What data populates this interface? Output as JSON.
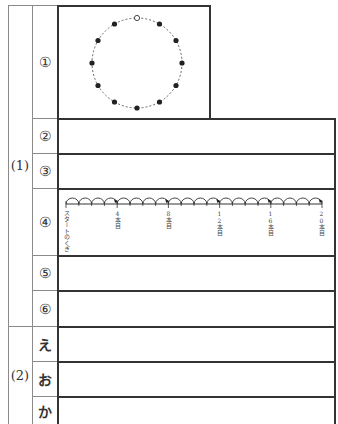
{
  "sections": [
    {
      "id": "1",
      "label": "(1)"
    },
    {
      "id": "2",
      "label": "(2)"
    }
  ],
  "rows": [
    {
      "key": "q1",
      "label": "①",
      "section": "(1)"
    },
    {
      "key": "q2",
      "label": "②",
      "section": "(1)"
    },
    {
      "key": "q3",
      "label": "③",
      "section": "(1)"
    },
    {
      "key": "q4",
      "label": "④",
      "section": "(1)"
    },
    {
      "key": "q5",
      "label": "⑤",
      "section": "(1)"
    },
    {
      "key": "q6",
      "label": "⑥",
      "section": "(1)"
    },
    {
      "key": "e",
      "label": "え",
      "section": "(2)"
    },
    {
      "key": "o",
      "label": "お",
      "section": "(2)"
    },
    {
      "key": "ka",
      "label": "か",
      "section": "(2)"
    }
  ],
  "circle_figure": {
    "total_points": 12,
    "open_point_position": "top",
    "filled_points": 11,
    "line_style": "dashed"
  },
  "number_line": {
    "start_label": "スタートのくぎ",
    "ticks": [
      {
        "label": "4本目"
      },
      {
        "label": "8本目"
      },
      {
        "label": "12本目"
      },
      {
        "label": "16本目"
      },
      {
        "label": "20本目"
      }
    ],
    "tick_labels_vertical": {
      "t4": "4\n本\n目",
      "t8": "8\n本\n目",
      "t12": "12\n本\n目",
      "t16": "16\n本\n目",
      "t20": "20\n本\n目"
    },
    "arc_count": 20
  }
}
